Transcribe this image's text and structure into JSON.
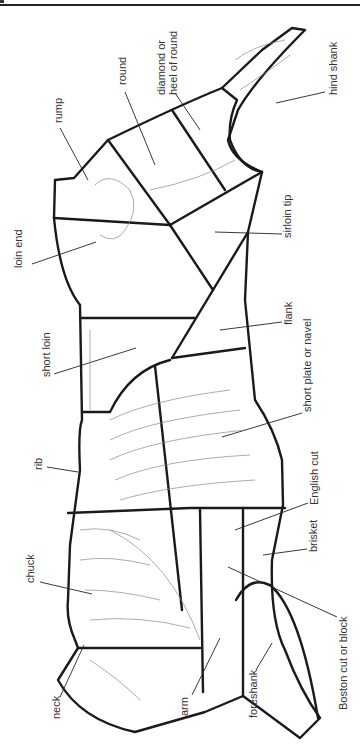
{
  "diagram": {
    "orientation": "rotated 90 degrees counter-clockwise",
    "labels": [
      {
        "id": "hind-shank",
        "text": "hind shank",
        "x": 329,
        "y": 95
      },
      {
        "id": "diamond",
        "text": "diamond or",
        "x": 157,
        "y": 95
      },
      {
        "id": "heel-of-round",
        "text": "heel of round",
        "x": 169,
        "y": 95
      },
      {
        "id": "round",
        "text": "round",
        "x": 118,
        "y": 85
      },
      {
        "id": "rump",
        "text": "rump",
        "x": 54,
        "y": 123
      },
      {
        "id": "loin-end",
        "text": "loin end",
        "x": 14,
        "y": 268
      },
      {
        "id": "sirloin-tip",
        "text": "sirloin tip",
        "x": 283,
        "y": 238
      },
      {
        "id": "flank",
        "text": "flank",
        "x": 284,
        "y": 325
      },
      {
        "id": "short-loin",
        "text": "short loin",
        "x": 42,
        "y": 377
      },
      {
        "id": "short-plate",
        "text": "short plate or navel",
        "x": 303,
        "y": 412
      },
      {
        "id": "rib",
        "text": "rib",
        "x": 34,
        "y": 470
      },
      {
        "id": "english-cut",
        "text": "English cut",
        "x": 310,
        "y": 505
      },
      {
        "id": "brisket",
        "text": "brisket",
        "x": 309,
        "y": 552
      },
      {
        "id": "chuck",
        "text": "chuck",
        "x": 26,
        "y": 583
      },
      {
        "id": "boston-cut",
        "text": "Boston cut or block",
        "x": 339,
        "y": 710
      },
      {
        "id": "neck",
        "text": "neck",
        "x": 52,
        "y": 719
      },
      {
        "id": "arm",
        "text": "arm",
        "x": 180,
        "y": 716
      },
      {
        "id": "foreshank",
        "text": "foreshank",
        "x": 249,
        "y": 718
      }
    ]
  }
}
